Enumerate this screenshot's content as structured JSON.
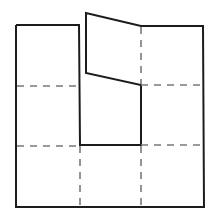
{
  "diagram": {
    "type": "folded-net-figure",
    "canvas": {
      "width": 215,
      "height": 221,
      "background": "#ffffff"
    },
    "colors": {
      "solid": "#1c1c1c",
      "dashed": "#7a7a7a"
    },
    "outline_points": "16,25 79,25 80,145 141,145 141,85 86,73 86,13 141,26 203,26 204,207 16,207 16,25",
    "parallelogram_points": "86,13 141,26 141,85 86,73",
    "dashed_lines": [
      {
        "x1": 17,
        "y1": 86,
        "x2": 79,
        "y2": 86
      },
      {
        "x1": 141,
        "y1": 85,
        "x2": 203,
        "y2": 85
      },
      {
        "x1": 17,
        "y1": 146,
        "x2": 80,
        "y2": 146
      },
      {
        "x1": 141,
        "y1": 145,
        "x2": 203,
        "y2": 145
      },
      {
        "x1": 141,
        "y1": 27,
        "x2": 141,
        "y2": 84
      },
      {
        "x1": 80,
        "y1": 146,
        "x2": 80,
        "y2": 206
      },
      {
        "x1": 141,
        "y1": 146,
        "x2": 141,
        "y2": 206
      }
    ]
  }
}
